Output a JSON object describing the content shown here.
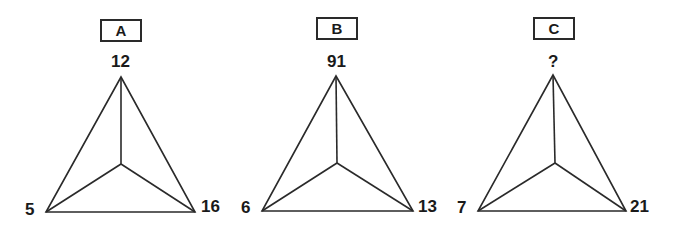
{
  "puzzle": {
    "panels": [
      {
        "label": "A",
        "top": "12",
        "left": "5",
        "right": "16"
      },
      {
        "label": "B",
        "top": "91",
        "left": "6",
        "right": "13"
      },
      {
        "label": "C",
        "top": "?",
        "left": "7",
        "right": "21"
      }
    ]
  }
}
